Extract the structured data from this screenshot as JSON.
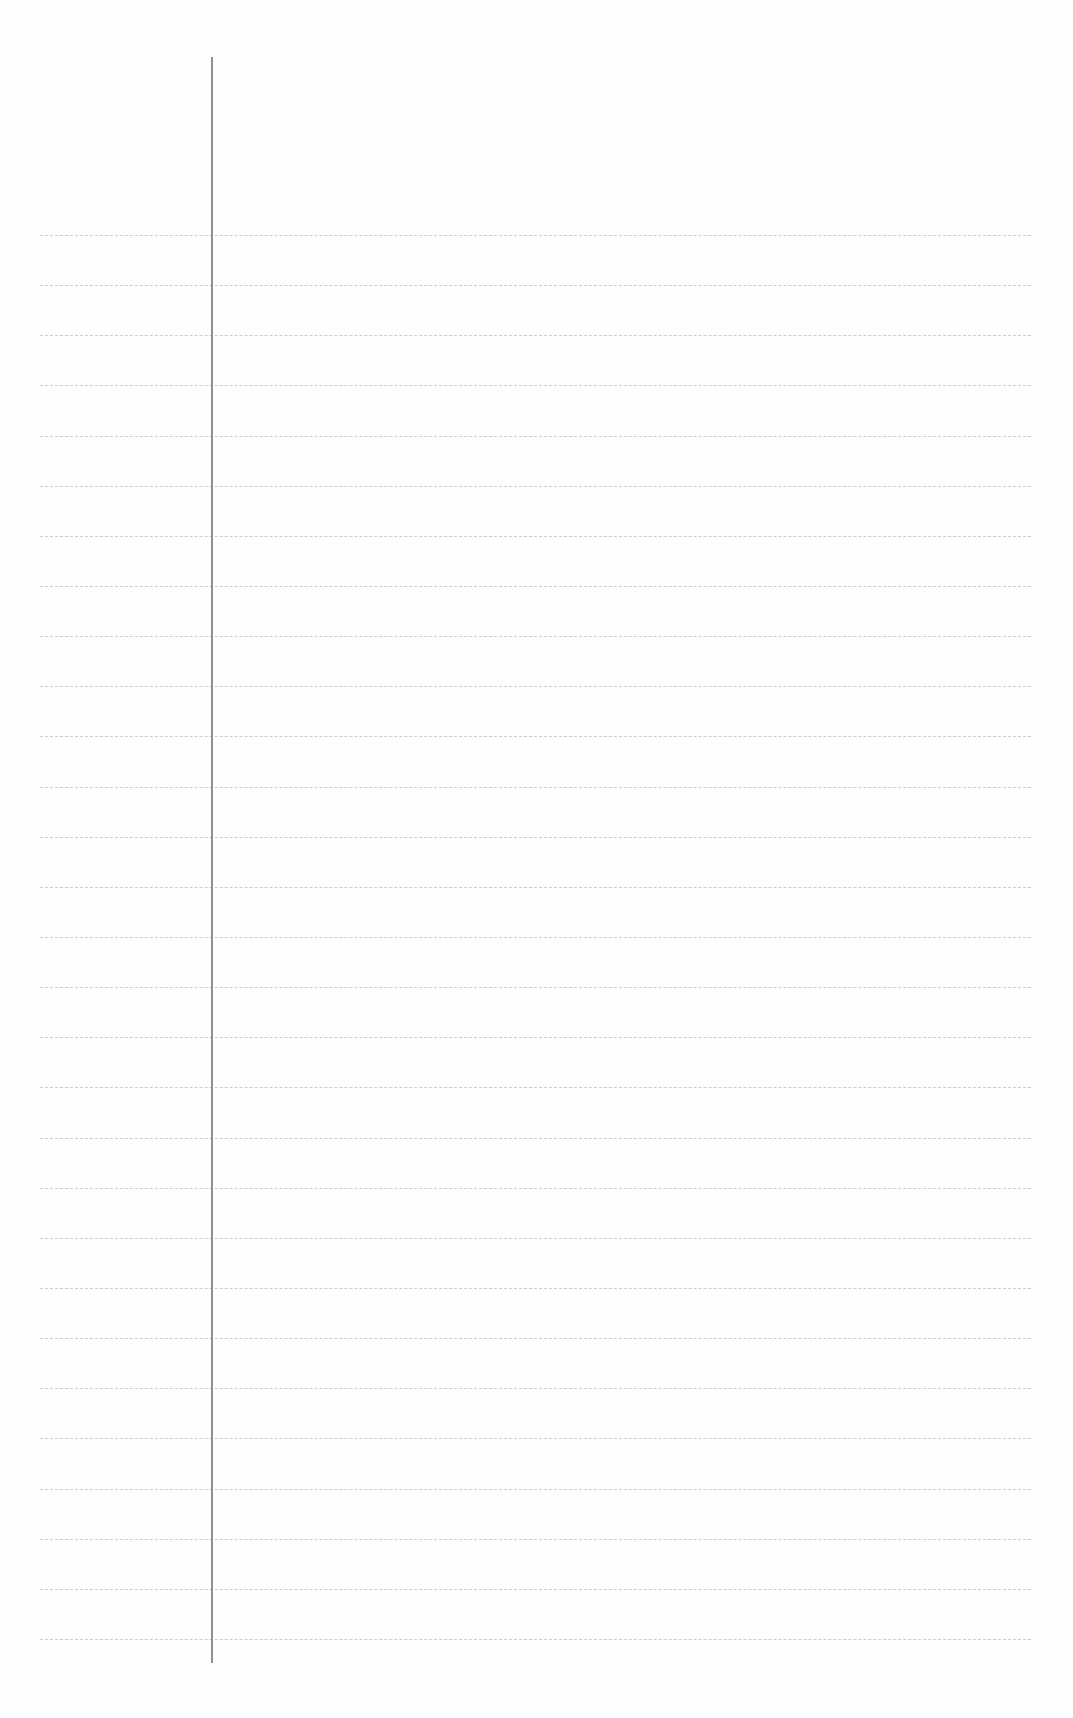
{
  "page": {
    "type": "lined-paper",
    "background_color": "#fefefe",
    "rule_color": "#c4c4c4",
    "margin_color": "#8f8f8f"
  },
  "rules": {
    "count": 29,
    "first_y": 235,
    "spacing": 50.14,
    "left_x": 40,
    "right_x": 1031
  },
  "margin": {
    "x": 212,
    "top_y": 57,
    "bottom_y": 1663
  }
}
